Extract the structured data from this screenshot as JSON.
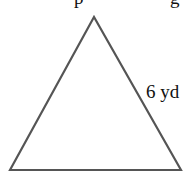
{
  "diagram": {
    "type": "equilateral-triangle",
    "stroke_color": "#555555",
    "background": "#ffffff",
    "vertices": {
      "apex": [
        94,
        17
      ],
      "bottom_left": [
        10,
        170
      ],
      "bottom_right": [
        181,
        170
      ]
    },
    "side_label": {
      "text": "6 yd",
      "side": "right"
    },
    "cropped_top_text": "p                    g"
  }
}
